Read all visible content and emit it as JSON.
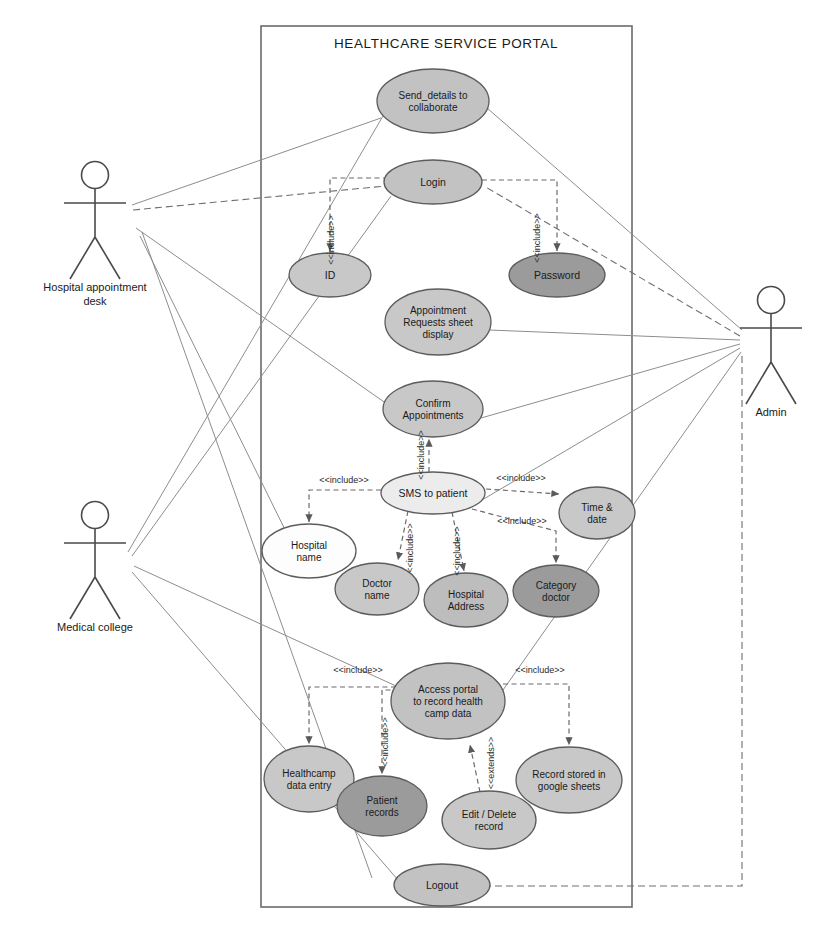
{
  "diagram": {
    "kind": "uml-use-case-diagram",
    "system": {
      "title": "HEALTHCARE SERVICE PORTAL",
      "box": {
        "x": 261,
        "y": 26,
        "width": 371,
        "height": 881
      }
    },
    "colors": {
      "fill_white": "#fdfdfd",
      "fill_light": "#d8d8d8",
      "fill_mid": "#c2c2c2",
      "fill_dark": "#9b9b9b",
      "stroke": "#5c5c5c",
      "line": "#8d8d8d",
      "text": "#1a1a1a"
    },
    "actors": [
      {
        "id": "hospital_desk",
        "label_lines": [
          "Hospital appointment",
          "desk"
        ],
        "x": 95,
        "y": 175
      },
      {
        "id": "medical_college",
        "label_lines": [
          "Medical college"
        ],
        "x": 95,
        "y": 515
      },
      {
        "id": "admin",
        "label_lines": [
          "Admin"
        ],
        "x": 771,
        "y": 300
      }
    ],
    "use_cases": [
      {
        "id": "send_details",
        "lines": [
          "Send_details to",
          "collaborate"
        ],
        "cx": 433,
        "cy": 101,
        "rx": 56,
        "ry": 32,
        "fill": "#c2c2c2"
      },
      {
        "id": "login",
        "lines": [
          "Login"
        ],
        "cx": 433,
        "cy": 182,
        "rx": 49,
        "ry": 22,
        "fill": "#c2c2c2"
      },
      {
        "id": "id",
        "lines": [
          "ID"
        ],
        "cx": 330,
        "cy": 275,
        "rx": 41,
        "ry": 22,
        "fill": "#c8c8c8"
      },
      {
        "id": "password",
        "lines": [
          "Password"
        ],
        "cx": 557,
        "cy": 275,
        "rx": 48,
        "ry": 22,
        "fill": "#9b9b9b"
      },
      {
        "id": "appt_requests",
        "lines": [
          "Appointment",
          "Requests sheet",
          "display"
        ],
        "cx": 438,
        "cy": 322,
        "rx": 53,
        "ry": 33,
        "fill": "#c8c8c8"
      },
      {
        "id": "confirm_appt",
        "lines": [
          "Confirm",
          "Appointments"
        ],
        "cx": 433,
        "cy": 409,
        "rx": 50,
        "ry": 28,
        "fill": "#c8c8c8"
      },
      {
        "id": "sms_patient",
        "lines": [
          "SMS to patient"
        ],
        "cx": 433,
        "cy": 493,
        "rx": 52,
        "ry": 21,
        "fill": "#ececec"
      },
      {
        "id": "hospital_name",
        "lines": [
          "Hospital",
          "name"
        ],
        "cx": 309,
        "cy": 551,
        "rx": 47,
        "ry": 27,
        "fill": "#fdfdfd"
      },
      {
        "id": "doctor_name",
        "lines": [
          "Doctor",
          "name"
        ],
        "cx": 377,
        "cy": 589,
        "rx": 42,
        "ry": 26,
        "fill": "#c8c8c8"
      },
      {
        "id": "hospital_addr",
        "lines": [
          "Hospital",
          "Address"
        ],
        "cx": 466,
        "cy": 600,
        "rx": 42,
        "ry": 27,
        "fill": "#bdbdbd"
      },
      {
        "id": "category_doc",
        "lines": [
          "Category",
          "doctor"
        ],
        "cx": 556,
        "cy": 591,
        "rx": 43,
        "ry": 26,
        "fill": "#9b9b9b"
      },
      {
        "id": "time_date",
        "lines": [
          "Time &",
          "date"
        ],
        "cx": 597,
        "cy": 513,
        "rx": 38,
        "ry": 26,
        "fill": "#c8c8c8"
      },
      {
        "id": "access_portal",
        "lines": [
          "Access portal",
          "to record health",
          "camp data"
        ],
        "cx": 448,
        "cy": 701,
        "rx": 57,
        "ry": 38,
        "fill": "#c2c2c2"
      },
      {
        "id": "healthcamp",
        "lines": [
          "Healthcamp",
          "data entry"
        ],
        "cx": 309,
        "cy": 779,
        "rx": 45,
        "ry": 33,
        "fill": "#c8c8c8"
      },
      {
        "id": "patient_rec",
        "lines": [
          "Patient",
          "records"
        ],
        "cx": 382,
        "cy": 806,
        "rx": 45,
        "ry": 30,
        "fill": "#9b9b9b"
      },
      {
        "id": "edit_delete",
        "lines": [
          "Edit / Delete",
          "record"
        ],
        "cx": 489,
        "cy": 820,
        "rx": 47,
        "ry": 29,
        "fill": "#c8c8c8"
      },
      {
        "id": "record_sheets",
        "lines": [
          "Record stored in",
          "google sheets"
        ],
        "cx": 569,
        "cy": 780,
        "rx": 53,
        "ry": 33,
        "fill": "#c8c8c8"
      },
      {
        "id": "logout",
        "lines": [
          "Logout"
        ],
        "cx": 442,
        "cy": 885,
        "rx": 48,
        "ry": 21,
        "fill": "#c2c2c2"
      }
    ],
    "include_labels": [
      {
        "text": "<<include>>",
        "x": 334,
        "y": 240,
        "rotate": -90
      },
      {
        "text": "<<include>>",
        "x": 540,
        "y": 238,
        "rotate": -90
      },
      {
        "text": "<<include>>",
        "x": 424,
        "y": 455,
        "rotate": -90
      },
      {
        "text": "<<include>>",
        "x": 344,
        "y": 483,
        "rotate": 0
      },
      {
        "text": "<<include>>",
        "x": 521,
        "y": 481,
        "rotate": 0
      },
      {
        "text": "<<include>>",
        "x": 522,
        "y": 524,
        "rotate": 0
      },
      {
        "text": "<<include>>",
        "x": 413,
        "y": 548,
        "rotate": -90
      },
      {
        "text": "<<include>>",
        "x": 460,
        "y": 551,
        "rotate": -90
      },
      {
        "text": "<<include>>",
        "x": 358,
        "y": 673,
        "rotate": 0
      },
      {
        "text": "<<include>>",
        "x": 540,
        "y": 673,
        "rotate": 0
      },
      {
        "text": "<<include>>",
        "x": 388,
        "y": 742,
        "rotate": -90
      },
      {
        "text": "<<extends>>",
        "x": 494,
        "y": 763,
        "rotate": -90
      }
    ],
    "associations": [
      {
        "from": "hospital_desk",
        "to": "send_details"
      },
      {
        "from": "hospital_desk",
        "to": "login"
      },
      {
        "from": "hospital_desk",
        "to": "confirm_appt"
      },
      {
        "from": "hospital_desk",
        "to": "logout"
      },
      {
        "from": "medical_college",
        "to": "send_details"
      },
      {
        "from": "medical_college",
        "to": "login"
      },
      {
        "from": "medical_college",
        "to": "access_portal"
      },
      {
        "from": "medical_college",
        "to": "logout"
      },
      {
        "from": "admin",
        "to": "send_details"
      },
      {
        "from": "admin",
        "to": "login"
      },
      {
        "from": "admin",
        "to": "appt_requests"
      },
      {
        "from": "admin",
        "to": "confirm_appt"
      },
      {
        "from": "admin",
        "to": "sms_patient"
      },
      {
        "from": "admin",
        "to": "access_portal"
      },
      {
        "from": "admin",
        "to": "logout"
      }
    ],
    "include_relations": [
      {
        "from": "login",
        "to": "id",
        "stereotype": "<<include>>"
      },
      {
        "from": "login",
        "to": "password",
        "stereotype": "<<include>>"
      },
      {
        "from": "sms_patient",
        "to": "confirm_appt",
        "stereotype": "<<include>>"
      },
      {
        "from": "sms_patient",
        "to": "hospital_name",
        "stereotype": "<<include>>"
      },
      {
        "from": "sms_patient",
        "to": "doctor_name",
        "stereotype": "<<include>>"
      },
      {
        "from": "sms_patient",
        "to": "hospital_addr",
        "stereotype": "<<include>>"
      },
      {
        "from": "sms_patient",
        "to": "time_date",
        "stereotype": "<<include>>"
      },
      {
        "from": "sms_patient",
        "to": "category_doc",
        "stereotype": "<<include>>"
      },
      {
        "from": "access_portal",
        "to": "healthcamp",
        "stereotype": "<<include>>"
      },
      {
        "from": "access_portal",
        "to": "patient_rec",
        "stereotype": "<<include>>"
      },
      {
        "from": "access_portal",
        "to": "record_sheets",
        "stereotype": "<<include>>"
      },
      {
        "from": "edit_delete",
        "to": "access_portal",
        "stereotype": "<<extends>>"
      }
    ]
  }
}
